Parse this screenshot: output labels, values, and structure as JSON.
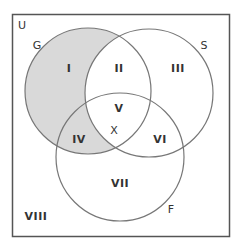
{
  "diagram": {
    "type": "venn",
    "universe": {
      "label": "U"
    },
    "sets": [
      {
        "id": "G",
        "label": "G",
        "shaded_only_outside_others": true
      },
      {
        "id": "S",
        "label": "S"
      },
      {
        "id": "F",
        "label": "F"
      }
    ],
    "regions": [
      {
        "label": "I",
        "in": [
          "G"
        ],
        "shaded": true
      },
      {
        "label": "II",
        "in": [
          "G",
          "S"
        ],
        "shaded": false
      },
      {
        "label": "III",
        "in": [
          "S"
        ],
        "shaded": false
      },
      {
        "label": "IV",
        "in": [
          "G",
          "F"
        ],
        "shaded": true
      },
      {
        "label": "V",
        "in": [
          "G",
          "S",
          "F"
        ],
        "shaded": false
      },
      {
        "label": "VI",
        "in": [
          "S",
          "F"
        ],
        "shaded": false
      },
      {
        "label": "VII",
        "in": [
          "F"
        ],
        "shaded": false
      },
      {
        "label": "VIII",
        "in": [],
        "shaded": false
      }
    ],
    "marker": {
      "label": "X",
      "region": "V"
    },
    "colors": {
      "shade": "#d9d9d9",
      "stroke": "#666666",
      "border": "#555555"
    }
  }
}
